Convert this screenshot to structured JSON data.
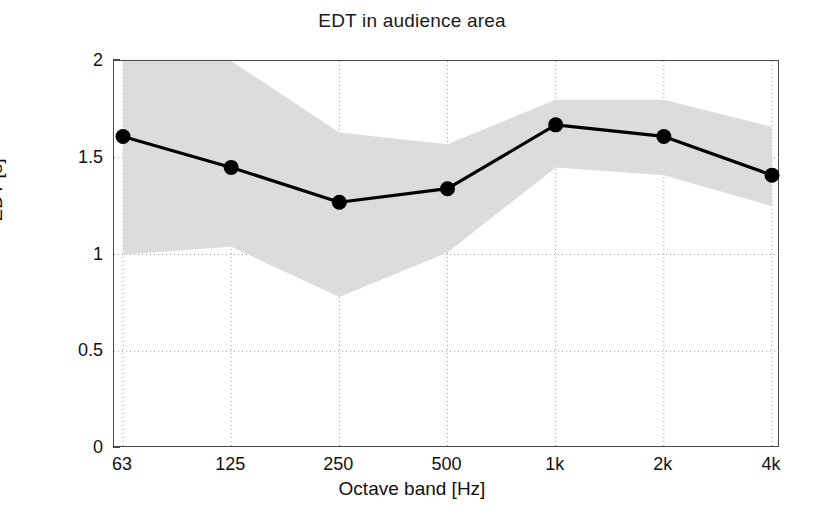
{
  "chart_data": {
    "type": "line",
    "title": "EDT in audience area",
    "xlabel": "Octave band [Hz]",
    "ylabel": "EDT [s]",
    "categories": [
      "63",
      "125",
      "250",
      "500",
      "1k",
      "2k",
      "4k"
    ],
    "values": [
      1.61,
      1.45,
      1.27,
      1.34,
      1.67,
      1.61,
      1.41
    ],
    "series": [
      {
        "name": "EDT mean",
        "values": [
          1.61,
          1.45,
          1.27,
          1.34,
          1.67,
          1.61,
          1.41
        ],
        "marker": "filled-circle",
        "color": "#000000"
      },
      {
        "name": "spread band upper",
        "values": [
          2.0,
          2.0,
          1.63,
          1.57,
          1.8,
          1.8,
          1.66
        ],
        "color": "#d9d9d9"
      },
      {
        "name": "spread band lower",
        "values": [
          1.0,
          1.04,
          0.78,
          1.01,
          1.45,
          1.41,
          1.25
        ],
        "color": "#d9d9d9"
      }
    ],
    "band_fill_color": "#dcdcdc",
    "band_note": "shaded spread region between upper and lower bounds, clipped at y = 2",
    "ylim": [
      0,
      2
    ],
    "yticks": [
      0,
      0.5,
      1,
      1.5,
      2
    ],
    "ytick_labels": [
      "0",
      "0.5",
      "1",
      "1.5",
      "2"
    ],
    "xtick_labels": [
      "63",
      "125",
      "250",
      "500",
      "1k",
      "2k",
      "4k"
    ],
    "grid": "dotted both axes",
    "legend": "none",
    "annotations": []
  },
  "figure": {
    "background_color": "#ffffff",
    "axis_color": "#4a4a4a",
    "line_color": "#000000",
    "grid_color": "#9a9a9a"
  }
}
